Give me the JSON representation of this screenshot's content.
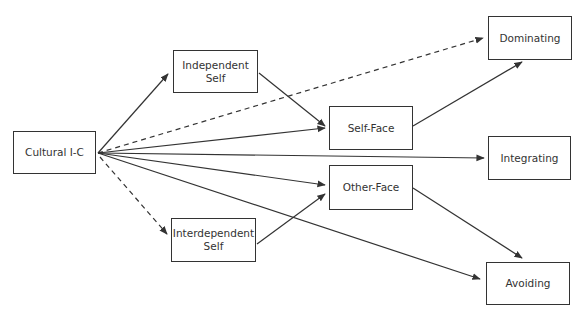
{
  "diagram": {
    "type": "path-model",
    "nodes": [
      {
        "id": "cultural_ic",
        "label": "Cultural I-C",
        "x": 13,
        "y": 131,
        "w": 83,
        "h": 43
      },
      {
        "id": "independent_self",
        "label": "Independent\nSelf",
        "x": 173,
        "y": 50,
        "w": 85,
        "h": 43
      },
      {
        "id": "interdependent_self",
        "label": "Interdependent\nSelf",
        "x": 171,
        "y": 218,
        "w": 85,
        "h": 44
      },
      {
        "id": "self_face",
        "label": "Self-Face",
        "x": 329,
        "y": 106,
        "w": 84,
        "h": 44
      },
      {
        "id": "other_face",
        "label": "Other-Face",
        "x": 329,
        "y": 165,
        "w": 84,
        "h": 45
      },
      {
        "id": "dominating",
        "label": "Dominating",
        "x": 488,
        "y": 16,
        "w": 84,
        "h": 44
      },
      {
        "id": "integrating",
        "label": "Integrating",
        "x": 488,
        "y": 136,
        "w": 83,
        "h": 44
      },
      {
        "id": "avoiding",
        "label": "Avoiding",
        "x": 486,
        "y": 262,
        "w": 84,
        "h": 43
      }
    ],
    "edges": [
      {
        "from": "cultural_ic",
        "to": "independent_self",
        "style": "solid"
      },
      {
        "from": "cultural_ic",
        "to": "dominating",
        "style": "dashed"
      },
      {
        "from": "cultural_ic",
        "to": "self_face",
        "style": "solid"
      },
      {
        "from": "cultural_ic",
        "to": "integrating",
        "style": "solid"
      },
      {
        "from": "cultural_ic",
        "to": "other_face",
        "style": "solid"
      },
      {
        "from": "cultural_ic",
        "to": "avoiding",
        "style": "solid"
      },
      {
        "from": "cultural_ic",
        "to": "interdependent_self",
        "style": "dashed"
      },
      {
        "from": "independent_self",
        "to": "self_face",
        "style": "solid"
      },
      {
        "from": "interdependent_self",
        "to": "other_face",
        "style": "solid"
      },
      {
        "from": "self_face",
        "to": "dominating",
        "style": "solid"
      },
      {
        "from": "other_face",
        "to": "avoiding",
        "style": "solid"
      }
    ]
  }
}
